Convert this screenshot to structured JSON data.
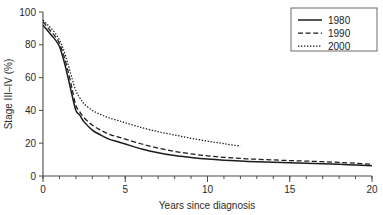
{
  "chart_data": {
    "type": "line",
    "title": "",
    "xlabel": "Years since diagnosis",
    "ylabel": "Stage III–IV (%)",
    "xlim": [
      0,
      20
    ],
    "ylim": [
      0,
      100
    ],
    "xticks": [
      0,
      5,
      10,
      15,
      20
    ],
    "xtick_labels": [
      "0",
      "5",
      "10",
      "15",
      "20"
    ],
    "x_minor_tick_interval": 1,
    "yticks": [
      0,
      20,
      40,
      60,
      80,
      100
    ],
    "ytick_labels": [
      "0",
      "20",
      "40",
      "60",
      "80",
      "100"
    ],
    "grid": false,
    "legend_position": "top-right",
    "series": [
      {
        "name": "1980",
        "style": "solid",
        "color": "#1c1c1c",
        "x": [
          0,
          0.25,
          0.5,
          0.75,
          1,
          1.25,
          1.5,
          1.75,
          2,
          2.25,
          2.5,
          3,
          3.5,
          4,
          4.5,
          5,
          6,
          7,
          8,
          9,
          10,
          11,
          12,
          13,
          14,
          15,
          16,
          17,
          18,
          19,
          20
        ],
        "y": [
          92,
          89,
          86,
          83,
          79,
          71,
          61,
          50,
          40,
          37,
          33,
          28,
          25,
          22.5,
          21,
          19.5,
          16.5,
          14.2,
          12.5,
          11.3,
          10.3,
          9.6,
          9.1,
          8.7,
          8.4,
          8.1,
          7.8,
          7.4,
          7.1,
          6.7,
          6.3
        ]
      },
      {
        "name": "1990",
        "style": "dashed",
        "color": "#1c1c1c",
        "x": [
          0,
          0.25,
          0.5,
          0.75,
          1,
          1.25,
          1.5,
          1.75,
          2,
          2.25,
          2.5,
          3,
          3.5,
          4,
          4.5,
          5,
          6,
          7,
          8,
          9,
          10,
          11,
          12,
          13,
          14,
          15,
          16,
          17,
          18,
          19,
          20
        ],
        "y": [
          94,
          91,
          88,
          85,
          81,
          74,
          65,
          54,
          43,
          39,
          35.5,
          31,
          28,
          25.5,
          24,
          22.5,
          19.5,
          17,
          15,
          13.5,
          12.3,
          11.4,
          10.7,
          10.2,
          9.8,
          9.4,
          9.1,
          8.7,
          8.3,
          7.8,
          7.2
        ]
      },
      {
        "name": "2000",
        "style": "dotted",
        "color": "#1c1c1c",
        "x": [
          0,
          0.25,
          0.5,
          0.75,
          1,
          1.25,
          1.5,
          1.75,
          2,
          2.25,
          2.5,
          3,
          3.5,
          4,
          4.5,
          5,
          6,
          7,
          8,
          9,
          10,
          11,
          12
        ],
        "y": [
          95,
          92.5,
          90,
          87,
          83,
          77,
          69,
          60,
          52,
          47.5,
          44,
          40,
          37.5,
          35.5,
          34,
          32.5,
          29.5,
          27,
          25,
          23,
          21.3,
          19.7,
          18.2
        ]
      }
    ],
    "notes": {
      "series_1980_end": "20 years, ~6%",
      "series_1990_end": "20 years, ~7%",
      "series_2000_end": "12 years, ~18%"
    }
  },
  "legend": {
    "entries": [
      {
        "label": "1980"
      },
      {
        "label": "1990"
      },
      {
        "label": "2000"
      }
    ]
  },
  "axes": {
    "x_title": "Years since diagnosis",
    "y_title": "Stage III–IV (%)"
  }
}
